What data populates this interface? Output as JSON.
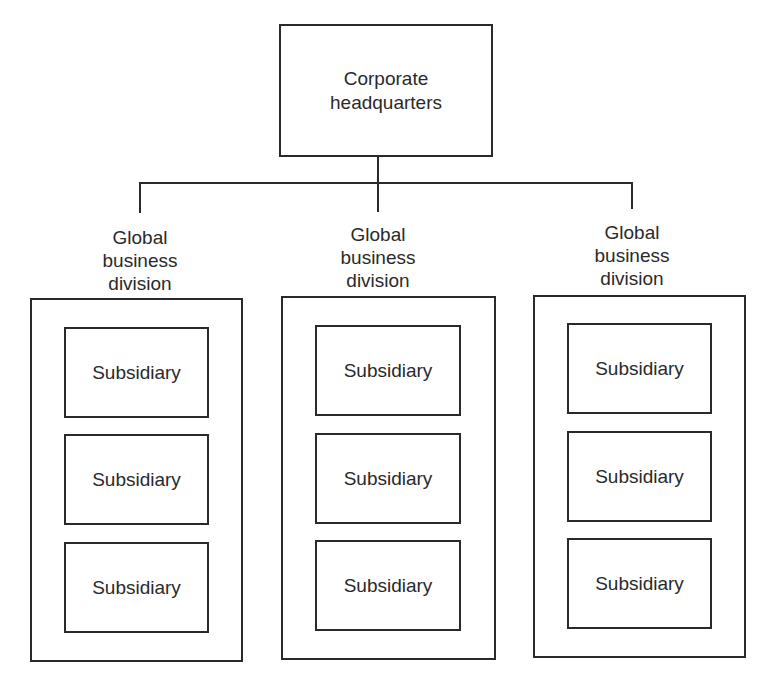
{
  "diagram": {
    "type": "org-chart",
    "root": {
      "label_line1": "Corporate",
      "label_line2": "headquarters"
    },
    "divisions": [
      {
        "label_lines": [
          "Global",
          "business",
          "division"
        ],
        "subsidiaries": [
          "Subsidiary",
          "Subsidiary",
          "Subsidiary"
        ]
      },
      {
        "label_lines": [
          "Global",
          "business",
          "division"
        ],
        "subsidiaries": [
          "Subsidiary",
          "Subsidiary",
          "Subsidiary"
        ]
      },
      {
        "label_lines": [
          "Global",
          "business",
          "division"
        ],
        "subsidiaries": [
          "Subsidiary",
          "Subsidiary",
          "Subsidiary"
        ]
      }
    ],
    "colors": {
      "stroke": "#2a2a2a",
      "background": "#ffffff",
      "text": "#2a2a2a"
    }
  }
}
